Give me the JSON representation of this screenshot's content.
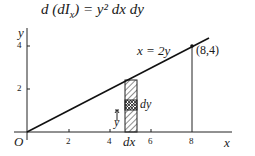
{
  "equation": {
    "lhs": "d (dI",
    "sub": "x",
    "rhs": ") = y² dx dy"
  },
  "diagram": {
    "axes": {
      "x_label": "x",
      "y_label": "y",
      "origin_label": "O",
      "x_ticks": [
        "2",
        "4",
        "6",
        "8"
      ],
      "y_ticks": [
        "2",
        "4"
      ]
    },
    "line_label": "x = 2y",
    "point_label": "(8,4)",
    "strip_width_label": "dx",
    "element_height_label": "dy",
    "element_y_label": "y"
  }
}
